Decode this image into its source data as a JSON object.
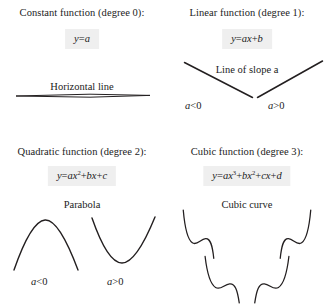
{
  "page": {
    "background_color": "#ffffff",
    "text_color": "#1b1b1b",
    "equation_box_color": "#efefef",
    "curve_stroke_color": "#231f20"
  },
  "panels": {
    "constant": {
      "heading": "Constant function (degree 0):",
      "equation": "y = a",
      "caption": "Horizontal line"
    },
    "linear": {
      "heading": "Linear function (degree 1):",
      "equation": "y = ax + b",
      "caption": "Line of slope a",
      "sign_negative": "a < 0",
      "sign_positive": "a > 0"
    },
    "quadratic": {
      "heading": "Quadratic function (degree 2):",
      "equation": "y = ax² + bx + c",
      "caption": "Parabola",
      "sign_negative": "a < 0",
      "sign_positive": "a > 0"
    },
    "cubic": {
      "heading": "Cubic function (degree 3):",
      "equation": "y = ax³ + bx² + cx + d",
      "caption": "Cubic curve"
    }
  },
  "equation_parts": {
    "constant": {
      "lhs": "y",
      "eq": "=",
      "a": "a"
    },
    "linear": {
      "lhs": "y",
      "eq": "=",
      "ax": "ax",
      "plus": "+",
      "b": "b"
    },
    "quadratic": {
      "lhs": "y",
      "eq": "=",
      "ax": "ax",
      "sup2": "2",
      "plus1": "+",
      "bx": "bx",
      "plus2": "+",
      "c": "c"
    },
    "cubic": {
      "lhs": "y",
      "eq": "=",
      "ax": "ax",
      "sup3": "3",
      "plus1": "+",
      "bx": "bx",
      "sup2": "2",
      "plus2": "+",
      "cx": "cx",
      "plus3": "+",
      "d": "d"
    }
  },
  "sign_parts": {
    "negative": {
      "var": "a",
      "op": "<",
      "num": "0"
    },
    "positive": {
      "var": "a",
      "op": ">",
      "num": "0"
    }
  }
}
